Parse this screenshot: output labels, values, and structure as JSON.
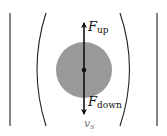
{
  "diagram": {
    "type": "physics free-body diagram",
    "labels": {
      "force_up": {
        "main": "F",
        "sub": "up"
      },
      "force_down": {
        "main": "F",
        "sub": "down"
      },
      "velocity": {
        "main": "v",
        "sub": "s"
      }
    },
    "colors": {
      "sphere": "#999999",
      "lines": "#222222",
      "velocity_label": "#888888",
      "background": "#ffffff"
    },
    "elements": {
      "left_wall": "straight vertical line",
      "right_wall": "straight vertical line",
      "left_flow_line": "concave curve bowing left",
      "right_flow_line": "concave curve bowing right",
      "sphere": "gray filled circle with center dot",
      "arrow_up": "vertical arrow upward from center",
      "arrow_down": "vertical arrow downward from center"
    }
  }
}
